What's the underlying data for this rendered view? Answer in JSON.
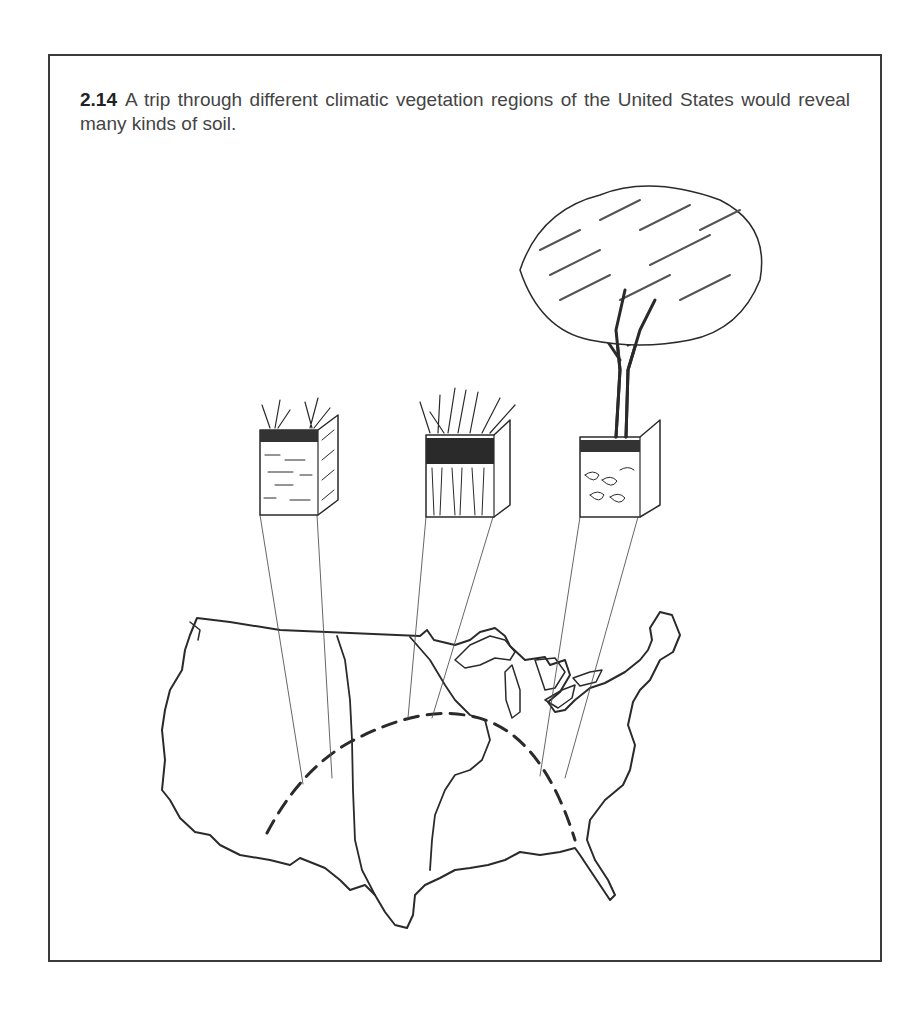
{
  "figure": {
    "number": "2.14",
    "caption": "A trip through different climatic vegetation regions of the United States would reveal many kinds of soil."
  },
  "illustration": {
    "subject": "Map of the contiguous United States with a dashed arc route and three soil profile blocks",
    "soil_profiles": [
      {
        "name": "desert-soil-profile",
        "vegetation": "sparse tufted grass",
        "texture": "pale layered horizons"
      },
      {
        "name": "grassland-soil-profile",
        "vegetation": "tall prairie grass",
        "texture": "dark thick topsoil with root streaks"
      },
      {
        "name": "forest-soil-profile",
        "vegetation": "deciduous tree",
        "texture": "thin dark topsoil over blocky subsoil"
      }
    ],
    "route": "dashed arc from southwest to southeast",
    "colors": {
      "ink": "#2a2a2a",
      "paper": "#ffffff",
      "frame": "#3a3a3a"
    }
  }
}
